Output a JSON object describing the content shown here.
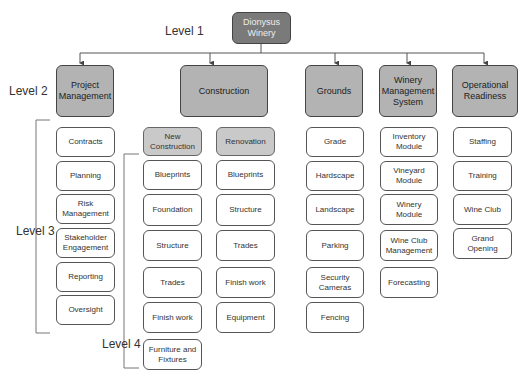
{
  "levels": {
    "level1": "Level 1",
    "level2": "Level 2",
    "level3": "Level 3",
    "level4": "Level 4"
  },
  "root": {
    "label": "Dionysus Winery"
  },
  "level2": [
    {
      "id": "pm",
      "label": "Project Management"
    },
    {
      "id": "construction",
      "label": "Construction"
    },
    {
      "id": "grounds",
      "label": "Grounds"
    },
    {
      "id": "wms",
      "label": "Winery Management System"
    },
    {
      "id": "or",
      "label": "Operational Readiness"
    }
  ],
  "project_management": [
    "Contracts",
    "Planning",
    "Risk Management",
    "Stakeholder Engagement",
    "Reporting",
    "Oversight"
  ],
  "construction": {
    "new_construction": {
      "label": "New Construction",
      "items": [
        "Blueprints",
        "Foundation",
        "Structure",
        "Trades",
        "Finish work",
        "Furniture and Fixtures"
      ]
    },
    "renovation": {
      "label": "Renovation",
      "items": [
        "Blueprints",
        "Structure",
        "Trades",
        "Finish work",
        "Equipment"
      ]
    }
  },
  "grounds": [
    "Grade",
    "Hardscape",
    "Landscape",
    "Parking",
    "Security Cameras",
    "Fencing"
  ],
  "winery_management_system": [
    "Inventory Module",
    "Vineyard Module",
    "Winery Module",
    "Wine Club Management",
    "Forecasting"
  ],
  "operational_readiness": [
    "Staffing",
    "Training",
    "Wine Club",
    "Grand Opening"
  ],
  "colors": {
    "root_fill": "#7a7a7a",
    "level2_fill": "#b3b3b3",
    "sub_fill": "#c9c9c9",
    "leaf_fill": "#ffffff",
    "stroke": "#555555"
  }
}
